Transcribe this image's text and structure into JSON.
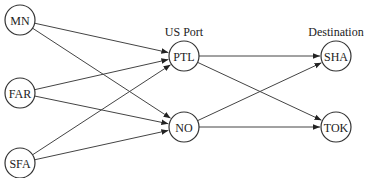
{
  "diagram": {
    "type": "network-flow",
    "column_labels": [
      {
        "id": "port",
        "text": "US Port",
        "column": "PTL"
      },
      {
        "id": "destination",
        "text": "Destination",
        "column": "SHA"
      }
    ],
    "nodes": [
      {
        "id": "MN",
        "label": "MN",
        "group": "origin"
      },
      {
        "id": "FAR",
        "label": "FAR",
        "group": "origin"
      },
      {
        "id": "SFA",
        "label": "SFA",
        "group": "origin"
      },
      {
        "id": "PTL",
        "label": "PTL",
        "group": "port"
      },
      {
        "id": "NO",
        "label": "NO",
        "group": "port"
      },
      {
        "id": "SHA",
        "label": "SHA",
        "group": "destination"
      },
      {
        "id": "TOK",
        "label": "TOK",
        "group": "destination"
      }
    ],
    "edges": [
      {
        "from": "MN",
        "to": "PTL"
      },
      {
        "from": "MN",
        "to": "NO"
      },
      {
        "from": "FAR",
        "to": "PTL"
      },
      {
        "from": "FAR",
        "to": "NO"
      },
      {
        "from": "SFA",
        "to": "PTL"
      },
      {
        "from": "SFA",
        "to": "NO"
      },
      {
        "from": "PTL",
        "to": "SHA"
      },
      {
        "from": "PTL",
        "to": "TOK"
      },
      {
        "from": "NO",
        "to": "SHA"
      },
      {
        "from": "NO",
        "to": "TOK"
      }
    ]
  }
}
